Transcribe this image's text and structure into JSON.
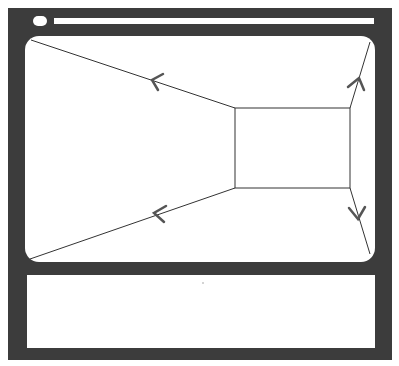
{
  "diagram": {
    "colors": {
      "frame": "#3c3c3c",
      "surface": "#ffffff",
      "line": "#333333",
      "arrow": "#555555"
    },
    "window_frame": {
      "x": 8,
      "y": 8,
      "w": 384,
      "h": 352
    },
    "title_bar": {
      "button": "window-control-pill",
      "address_bar": "blank"
    },
    "viewport": {
      "x": 25,
      "y": 36,
      "w": 350,
      "h": 226
    },
    "inner_rect": {
      "x1": 235,
      "y1": 108,
      "x2": 350,
      "y2": 188
    },
    "arrows": [
      {
        "name": "top-left",
        "direction": "outward"
      },
      {
        "name": "bottom-left",
        "direction": "outward"
      },
      {
        "name": "top-right",
        "direction": "outward"
      },
      {
        "name": "bottom-right",
        "direction": "outward"
      }
    ],
    "bottom_panel": {
      "content": ""
    }
  }
}
